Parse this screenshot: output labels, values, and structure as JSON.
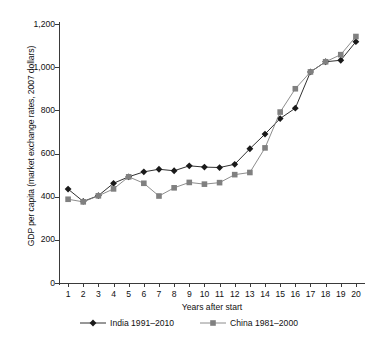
{
  "chart_data": {
    "type": "line",
    "title": "",
    "xlabel": "Years after start",
    "ylabel": "GDP per capita (market exchange rates, 2007 dollars)",
    "x": [
      1,
      2,
      3,
      4,
      5,
      6,
      7,
      8,
      9,
      10,
      11,
      12,
      13,
      14,
      15,
      16,
      17,
      18,
      19,
      20
    ],
    "xlim": [
      0.4,
      20.6
    ],
    "ylim": [
      0,
      1200
    ],
    "xticks": [
      "1",
      "2",
      "3",
      "4",
      "5",
      "6",
      "7",
      "8",
      "9",
      "10",
      "11",
      "12",
      "13",
      "14",
      "15",
      "16",
      "17",
      "18",
      "19",
      "20"
    ],
    "yticks": [
      "0",
      "200",
      "400",
      "600",
      "800",
      "1,000",
      "1,200"
    ],
    "ytick_values": [
      0,
      200,
      400,
      600,
      800,
      1000,
      1200
    ],
    "grid": false,
    "legend_position": "bottom",
    "series": [
      {
        "name": "India 1991–2010",
        "marker": "diamond",
        "color": "#1a1a1a",
        "values": [
          435,
          378,
          405,
          462,
          492,
          515,
          527,
          520,
          543,
          537,
          535,
          550,
          622,
          690,
          762,
          810,
          978,
          1025,
          1032,
          1118
        ]
      },
      {
        "name": "China 1981–2000",
        "marker": "square",
        "color": "#808080",
        "values": [
          388,
          376,
          404,
          436,
          492,
          462,
          403,
          441,
          466,
          458,
          465,
          502,
          512,
          626,
          792,
          900,
          978,
          1025,
          1058,
          1142
        ]
      }
    ]
  },
  "legend": {
    "entries": [
      {
        "label": "India 1991–2010"
      },
      {
        "label": "China 1981–2000"
      }
    ]
  },
  "axes": {
    "x_title": "Years after start",
    "y_title": "GDP per capita (market exchange rates, 2007 dollars)"
  }
}
